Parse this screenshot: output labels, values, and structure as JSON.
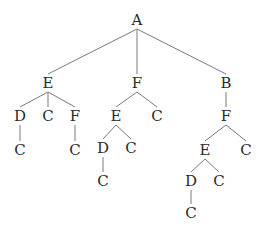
{
  "diagram": {
    "type": "tree",
    "edge_color": "#7a7a7a",
    "text_color": "#2a2a2a",
    "nodes": [
      {
        "id": "n0",
        "label": "A",
        "x": 137,
        "y": 20
      },
      {
        "id": "n1",
        "label": "E",
        "x": 48,
        "y": 83
      },
      {
        "id": "n2",
        "label": "F",
        "x": 137,
        "y": 83
      },
      {
        "id": "n3",
        "label": "B",
        "x": 226,
        "y": 83
      },
      {
        "id": "n4",
        "label": "D",
        "x": 20,
        "y": 116
      },
      {
        "id": "n5",
        "label": "C",
        "x": 48,
        "y": 116
      },
      {
        "id": "n6",
        "label": "F",
        "x": 75,
        "y": 116
      },
      {
        "id": "n7",
        "label": "C",
        "x": 20,
        "y": 150
      },
      {
        "id": "n8",
        "label": "C",
        "x": 75,
        "y": 150
      },
      {
        "id": "n9",
        "label": "E",
        "x": 116,
        "y": 116
      },
      {
        "id": "n10",
        "label": "C",
        "x": 157,
        "y": 116
      },
      {
        "id": "n11",
        "label": "D",
        "x": 103,
        "y": 148
      },
      {
        "id": "n12",
        "label": "C",
        "x": 131,
        "y": 148
      },
      {
        "id": "n13",
        "label": "C",
        "x": 103,
        "y": 181
      },
      {
        "id": "n14",
        "label": "F",
        "x": 226,
        "y": 116
      },
      {
        "id": "n15",
        "label": "E",
        "x": 205,
        "y": 150
      },
      {
        "id": "n16",
        "label": "C",
        "x": 246,
        "y": 150
      },
      {
        "id": "n17",
        "label": "D",
        "x": 191,
        "y": 181
      },
      {
        "id": "n18",
        "label": "C",
        "x": 219,
        "y": 181
      },
      {
        "id": "n19",
        "label": "C",
        "x": 191,
        "y": 213
      }
    ],
    "edges": [
      [
        "n0",
        "n1"
      ],
      [
        "n0",
        "n2"
      ],
      [
        "n0",
        "n3"
      ],
      [
        "n1",
        "n4"
      ],
      [
        "n1",
        "n5"
      ],
      [
        "n1",
        "n6"
      ],
      [
        "n4",
        "n7"
      ],
      [
        "n6",
        "n8"
      ],
      [
        "n2",
        "n9"
      ],
      [
        "n2",
        "n10"
      ],
      [
        "n9",
        "n11"
      ],
      [
        "n9",
        "n12"
      ],
      [
        "n11",
        "n13"
      ],
      [
        "n3",
        "n14"
      ],
      [
        "n14",
        "n15"
      ],
      [
        "n14",
        "n16"
      ],
      [
        "n15",
        "n17"
      ],
      [
        "n15",
        "n18"
      ],
      [
        "n17",
        "n19"
      ]
    ]
  }
}
